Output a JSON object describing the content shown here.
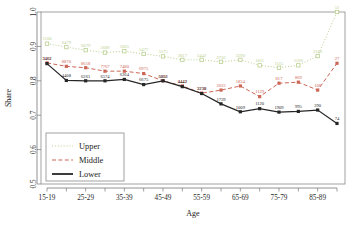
{
  "chart_data": {
    "type": "line",
    "title": "",
    "xlabel": "Age",
    "ylabel": "Share",
    "ylim": [
      0.5,
      1.0
    ],
    "ytick_labels": [
      "0.5",
      "0.6",
      "0.7",
      "0.8",
      "0.9",
      "1.0"
    ],
    "ytick_values": [
      0.5,
      0.6,
      0.7,
      0.8,
      0.9,
      1.0
    ],
    "grid": false,
    "legend_position": "bottom-left",
    "categories": [
      "15-19",
      "20-24",
      "25-29",
      "30-34",
      "35-39",
      "40-44",
      "45-49",
      "50-54",
      "55-59",
      "60-64",
      "65-69",
      "70-74",
      "75-79",
      "80-84",
      "85-89",
      "90+"
    ],
    "xtick_labels": [
      "15-19",
      "25-29",
      "35-39",
      "45-49",
      "55-59",
      "65-69",
      "75-79",
      "85-89"
    ],
    "xtick_indices": [
      0,
      2,
      4,
      6,
      8,
      10,
      12,
      14
    ],
    "series": [
      {
        "name": "Upper",
        "color": "#b9cf8f",
        "style": "dotted",
        "marker": "square-open",
        "values": [
          0.908,
          0.898,
          0.889,
          0.882,
          0.886,
          0.878,
          0.871,
          0.861,
          0.861,
          0.855,
          0.861,
          0.845,
          0.838,
          0.845,
          0.872,
          1.0
        ],
        "point_labels": [
          "1100",
          "6479",
          "6079",
          "5689",
          "5605",
          "5477",
          "5575",
          "2817",
          "2442",
          "2756",
          "2290",
          "1011",
          "1115",
          "1596",
          "2106",
          "51"
        ]
      },
      {
        "name": "Middle",
        "color": "#cc6655",
        "style": "dashed",
        "marker": "square-filled",
        "values": [
          0.852,
          0.842,
          0.838,
          0.828,
          0.828,
          0.821,
          0.8,
          0.785,
          0.764,
          0.773,
          0.785,
          0.754,
          0.793,
          0.796,
          0.773,
          0.851
        ],
        "point_labels": [
          "3101",
          "8870",
          "8618",
          "7767",
          "7480",
          "6975",
          "6386",
          "6442",
          "5738",
          "2622",
          "1834",
          "1129",
          "817",
          "869",
          "106",
          "27"
        ]
      },
      {
        "name": "Lower",
        "color": "#262626",
        "style": "solid",
        "marker": "square-filled",
        "values": [
          0.85,
          0.801,
          0.8,
          0.8,
          0.804,
          0.789,
          0.8,
          0.783,
          0.763,
          0.733,
          0.71,
          0.719,
          0.709,
          0.711,
          0.715,
          0.676
        ],
        "point_labels": [
          "3462",
          "4408",
          "6261",
          "6574",
          "6364",
          "6675",
          "5852",
          "4442",
          "3238",
          "1739",
          "1009",
          "1120",
          "1909",
          "995",
          "290",
          "74"
        ]
      }
    ]
  },
  "legend": {
    "items": [
      {
        "label": "Upper"
      },
      {
        "label": "Middle"
      },
      {
        "label": "Lower"
      }
    ]
  }
}
